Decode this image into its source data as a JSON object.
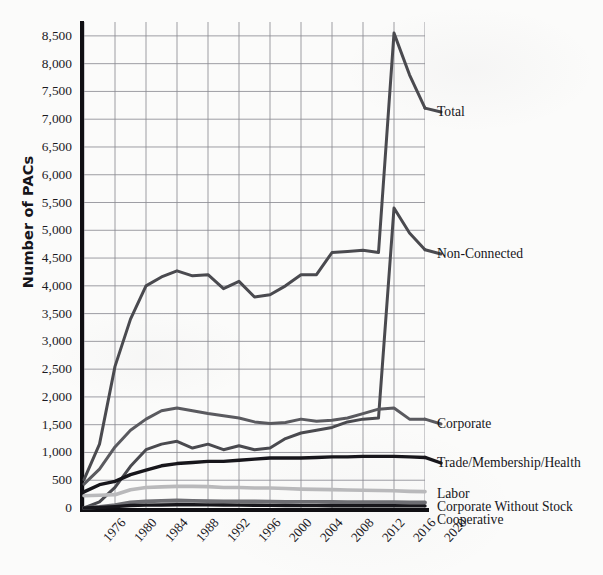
{
  "chart_data": {
    "type": "line",
    "title": "",
    "xlabel": "",
    "ylabel": "Number of PACs",
    "ylim": [
      0,
      8750
    ],
    "yticks": [
      0,
      500,
      1000,
      1500,
      2000,
      2500,
      3000,
      3500,
      4000,
      4500,
      5000,
      5500,
      6000,
      6500,
      7000,
      7500,
      8000,
      8500
    ],
    "ytick_labels": [
      "0",
      "500",
      "1,000",
      "1,500",
      "2,000",
      "2,500",
      "3,000",
      "3,500",
      "4,000",
      "4,500",
      "5,000",
      "5,500",
      "6,000",
      "6,500",
      "7,000",
      "7,500",
      "8,000",
      "8,500"
    ],
    "xlim": [
      1976,
      2020
    ],
    "x": [
      1976,
      1978,
      1980,
      1982,
      1984,
      1986,
      1988,
      1990,
      1992,
      1994,
      1996,
      1998,
      2000,
      2002,
      2004,
      2006,
      2008,
      2010,
      2012,
      2014,
      2016,
      2018,
      2020
    ],
    "xticks": [
      1976,
      1980,
      1984,
      1988,
      1992,
      1996,
      2000,
      2004,
      2008,
      2012,
      2016,
      2020
    ],
    "xtick_labels": [
      "1976",
      "1980",
      "1984",
      "1988",
      "1992",
      "1996",
      "2000",
      "2004",
      "2008",
      "2012",
      "2016",
      "2020"
    ],
    "grid": true,
    "legend_position": "right-inline-callouts",
    "series": [
      {
        "name": "Total",
        "color": "#4a4a4f",
        "values": [
          510,
          1150,
          2550,
          3400,
          4000,
          4160,
          4270,
          4180,
          4200,
          3950,
          4080,
          3800,
          3840,
          4000,
          4200,
          4200,
          4600,
          4620,
          4640,
          4600,
          8550,
          7800,
          7200
        ]
      },
      {
        "name": "Non-Connected",
        "color": "#4a4a4f",
        "values": [
          0,
          110,
          370,
          750,
          1050,
          1150,
          1200,
          1080,
          1150,
          1050,
          1120,
          1050,
          1080,
          1250,
          1350,
          1400,
          1450,
          1550,
          1600,
          1620,
          5400,
          4950,
          4650
        ]
      },
      {
        "name": "Corporate",
        "color": "#5a5a5f",
        "values": [
          430,
          700,
          1100,
          1400,
          1600,
          1750,
          1800,
          1750,
          1700,
          1660,
          1620,
          1550,
          1520,
          1540,
          1600,
          1560,
          1580,
          1620,
          1700,
          1780,
          1800,
          1600,
          1600
        ]
      },
      {
        "name": "Trade/Membership/Health",
        "color": "#17161b",
        "values": [
          290,
          420,
          480,
          600,
          680,
          760,
          800,
          820,
          840,
          840,
          860,
          880,
          900,
          900,
          900,
          910,
          920,
          920,
          930,
          930,
          930,
          920,
          910
        ]
      },
      {
        "name": "Labor",
        "color": "#b9b9bb",
        "values": [
          220,
          230,
          240,
          330,
          370,
          380,
          390,
          390,
          385,
          370,
          370,
          360,
          360,
          350,
          340,
          335,
          330,
          325,
          320,
          315,
          310,
          300,
          295
        ]
      },
      {
        "name": "Corporate Without Stock",
        "color": "#6e6e73",
        "values": [
          0,
          20,
          50,
          100,
          120,
          130,
          135,
          130,
          125,
          120,
          120,
          118,
          115,
          112,
          110,
          110,
          108,
          105,
          105,
          105,
          105,
          102,
          100
        ]
      },
      {
        "name": "Cooperative",
        "color": "#17161b",
        "values": [
          0,
          10,
          25,
          45,
          52,
          55,
          58,
          58,
          56,
          54,
          52,
          50,
          48,
          45,
          42,
          42,
          40,
          40,
          40,
          40,
          40,
          38,
          38
        ]
      }
    ],
    "annotations": [
      {
        "text": "Total",
        "series": "Total"
      },
      {
        "text": "Non-Connected",
        "series": "Non-Connected"
      },
      {
        "text": "Corporate",
        "series": "Corporate"
      },
      {
        "text": "Trade/Membership/Health",
        "series": "Trade/Membership/Health"
      },
      {
        "text": "Labor",
        "series": "Labor"
      },
      {
        "text": "Corporate Without Stock",
        "series": "Corporate Without Stock"
      },
      {
        "text": "Cooperative",
        "series": "Cooperative"
      }
    ]
  },
  "colors": {
    "background": "#fbfbfa",
    "axis": "#100f13",
    "grid": "#8d8d94",
    "text": "#17161b"
  }
}
